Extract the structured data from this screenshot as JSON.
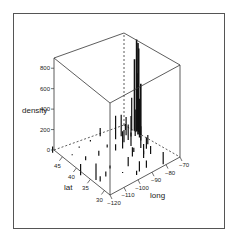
{
  "chart_data": {
    "type": "bar3d",
    "title": "",
    "xlabel": "long",
    "ylabel": "lat",
    "zlabel": "density",
    "x_ticks": [
      -120,
      -110,
      -100,
      -90,
      -80,
      -70
    ],
    "y_ticks": [
      30,
      35,
      40,
      45
    ],
    "z_ticks": [
      0,
      200,
      400,
      600,
      800
    ],
    "xlim": [
      -120,
      -70
    ],
    "ylim": [
      28,
      48
    ],
    "zlim": [
      0,
      900
    ],
    "grid": false,
    "legend": "none",
    "points": [
      {
        "long": -75,
        "lat": 41,
        "density": 900
      },
      {
        "long": -74,
        "lat": 41,
        "density": 860
      },
      {
        "long": -74.5,
        "lat": 40.5,
        "density": 820
      },
      {
        "long": -75.5,
        "lat": 41.5,
        "density": 700
      },
      {
        "long": -76,
        "lat": 40,
        "density": 600
      },
      {
        "long": -75,
        "lat": 39.5,
        "density": 500
      },
      {
        "long": -73.5,
        "lat": 41.5,
        "density": 450
      },
      {
        "long": -77,
        "lat": 39,
        "density": 380
      },
      {
        "long": -76.5,
        "lat": 42,
        "density": 320
      },
      {
        "long": -78,
        "lat": 40,
        "density": 260
      },
      {
        "long": -72,
        "lat": 42,
        "density": 230
      },
      {
        "long": -80,
        "lat": 40.5,
        "density": 200
      },
      {
        "long": -84,
        "lat": 42,
        "density": 210
      },
      {
        "long": -88,
        "lat": 42,
        "density": 230
      },
      {
        "long": -90,
        "lat": 38.5,
        "density": 170
      },
      {
        "long": -83,
        "lat": 40,
        "density": 150
      },
      {
        "long": -81.5,
        "lat": 41.5,
        "density": 180
      },
      {
        "long": -86,
        "lat": 40,
        "density": 120
      },
      {
        "long": -85,
        "lat": 38,
        "density": 130
      },
      {
        "long": -80,
        "lat": 35,
        "density": 110
      },
      {
        "long": -84,
        "lat": 34,
        "density": 100
      },
      {
        "long": -82,
        "lat": 36,
        "density": 120
      },
      {
        "long": -78,
        "lat": 38,
        "density": 140
      },
      {
        "long": -77,
        "lat": 36,
        "density": 90
      },
      {
        "long": -81,
        "lat": 33,
        "density": 80
      },
      {
        "long": -90,
        "lat": 35,
        "density": 90
      },
      {
        "long": -95,
        "lat": 30,
        "density": 100
      },
      {
        "long": -97,
        "lat": 33,
        "density": 90
      },
      {
        "long": -90,
        "lat": 30,
        "density": 70
      },
      {
        "long": -86,
        "lat": 33,
        "density": 70
      },
      {
        "long": -81,
        "lat": 28.5,
        "density": 120
      },
      {
        "long": -94,
        "lat": 39,
        "density": 60
      },
      {
        "long": -93,
        "lat": 45,
        "density": 80
      },
      {
        "long": -104,
        "lat": 40,
        "density": 50
      },
      {
        "long": -112,
        "lat": 33.5,
        "density": 50
      },
      {
        "long": -118,
        "lat": 34,
        "density": 160
      },
      {
        "long": -122,
        "lat": 37.5,
        "density": 110
      },
      {
        "long": -122,
        "lat": 47.5,
        "density": 60
      },
      {
        "long": -112,
        "lat": 40.7,
        "density": 40
      },
      {
        "long": -106,
        "lat": 35,
        "density": 30
      },
      {
        "long": -117,
        "lat": 33,
        "density": 50
      },
      {
        "long": -98,
        "lat": 29.5,
        "density": 40
      },
      {
        "long": -96,
        "lat": 41,
        "density": 30
      },
      {
        "long": -87,
        "lat": 36,
        "density": 40
      },
      {
        "long": -79,
        "lat": 43,
        "density": 60
      },
      {
        "long": -71,
        "lat": 42.3,
        "density": 150
      },
      {
        "long": -100,
        "lat": 45,
        "density": 15
      },
      {
        "long": -108,
        "lat": 45,
        "density": 10
      },
      {
        "long": -115,
        "lat": 44,
        "density": 10
      },
      {
        "long": -103,
        "lat": 32,
        "density": 10
      }
    ]
  }
}
